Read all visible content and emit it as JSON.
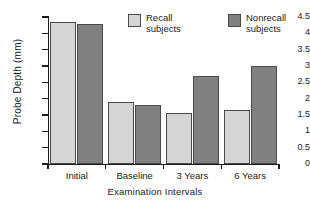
{
  "chart_data": {
    "type": "bar",
    "title": "",
    "xlabel": "Examination Intervals",
    "ylabel": "Probe Depth (mm)",
    "categories": [
      "Initial",
      "Baseline",
      "3 Years",
      "6 Years"
    ],
    "series": [
      {
        "name": "Recall subjects",
        "color": "#d5d5d5",
        "values": [
          4.35,
          1.9,
          1.55,
          1.65
        ]
      },
      {
        "name": "Nonrecall subjects",
        "color": "#808080",
        "values": [
          4.28,
          1.82,
          2.68,
          3.0
        ]
      }
    ],
    "ylim": [
      0,
      4.5
    ],
    "yticks": [
      "0",
      "0.5",
      "1",
      "1.5",
      "2",
      "2.5",
      "3",
      "3.5",
      "4",
      "4.5"
    ],
    "ytick_values": [
      0,
      0.5,
      1,
      1.5,
      2,
      2.5,
      3,
      3.5,
      4,
      4.5
    ],
    "grid": false,
    "legend_position": "top-center"
  },
  "legend": {
    "entries": [
      {
        "label_line1": "Recall",
        "label_line2": "subjects",
        "swatch": "recall-swatch"
      },
      {
        "label_line1": "Nonrecall",
        "label_line2": "subjects",
        "swatch": "nonrecall-swatch"
      }
    ]
  }
}
